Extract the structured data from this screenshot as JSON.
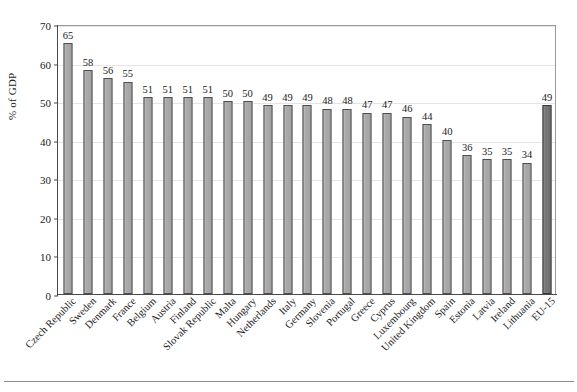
{
  "chart_data": {
    "type": "bar",
    "title": "",
    "subtitle": "",
    "xlabel": "",
    "ylabel": "% of GDP",
    "ylim": [
      0,
      70
    ],
    "ytick_step": 10,
    "yticks": [
      "0",
      "10",
      "20",
      "30",
      "40",
      "50",
      "60",
      "70"
    ],
    "grid": true,
    "legend": "none",
    "value_labels": true,
    "categories": [
      "Czech Republic",
      "Sweden",
      "Denmark",
      "France",
      "Belgium",
      "Austria",
      "Finland",
      "Slovak Republic",
      "Malta",
      "Hungary",
      "Netherlands",
      "Italy",
      "Germany",
      "Slovenia",
      "Portugal",
      "Greece",
      "Cyprus",
      "Luxembourg",
      "United Kingdom",
      "Spain",
      "Estonia",
      "Latvia",
      "Ireland",
      "Lithuania",
      "EU-15"
    ],
    "values": [
      65,
      58,
      56,
      55,
      51,
      51,
      51,
      51,
      50,
      50,
      49,
      49,
      49,
      48,
      48,
      47,
      47,
      46,
      44,
      40,
      36,
      35,
      35,
      34,
      49
    ],
    "highlight_index": 24,
    "colors": {
      "bar": "#a9a9a9",
      "bar_border": "#4f4f4f",
      "bar_highlight": "#7b7b7b",
      "bar_highlight_border": "#3a3a3a",
      "axis": "#4a4a4a",
      "grid": "#e9e4e4",
      "frame": "#9a9a9a",
      "text": "#1a1a1a",
      "background": "#ffffff"
    }
  }
}
